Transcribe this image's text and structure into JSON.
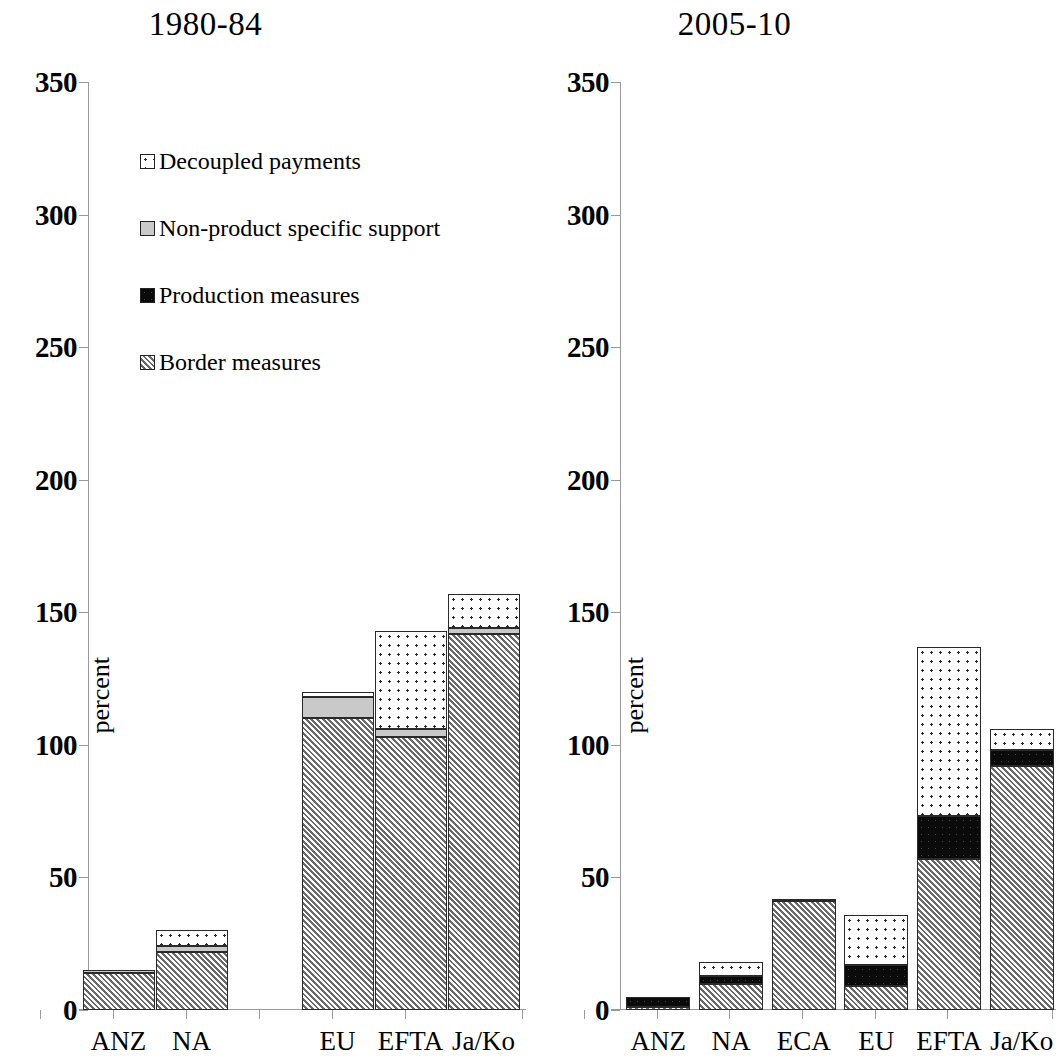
{
  "chart_data": [
    {
      "type": "bar",
      "title": "1980-84",
      "xlabel": "",
      "ylabel": "percent",
      "ylim": [
        0,
        350
      ],
      "yticks": [
        0,
        50,
        100,
        150,
        200,
        250,
        300,
        350
      ],
      "grid": false,
      "stacked": true,
      "legend_position": "inside-top-left",
      "categories": [
        "ANZ",
        "NA",
        "",
        "EU",
        "EFTA",
        "Ja/Ko"
      ],
      "series": [
        {
          "name": "Border measures",
          "values": [
            14,
            22,
            0,
            110,
            103,
            142
          ]
        },
        {
          "name": "Production measures",
          "values": [
            0,
            0,
            0,
            0,
            0,
            0
          ]
        },
        {
          "name": "Non-product specific  support",
          "values": [
            1,
            2,
            0,
            8,
            3,
            2
          ]
        },
        {
          "name": "Decoupled payments",
          "values": [
            0,
            6,
            0,
            2,
            37,
            13
          ]
        }
      ],
      "totals": [
        15,
        30,
        0,
        120,
        143,
        157
      ]
    },
    {
      "type": "bar",
      "title": "2005-10",
      "xlabel": "",
      "ylabel": "percent",
      "ylim": [
        0,
        350
      ],
      "yticks": [
        0,
        50,
        100,
        150,
        200,
        250,
        300,
        350
      ],
      "grid": false,
      "stacked": true,
      "legend_position": "none",
      "categories": [
        "ANZ",
        "NA",
        "ECA",
        "EU",
        "EFTA",
        "Ja/Ko"
      ],
      "series": [
        {
          "name": "Border measures",
          "values": [
            1,
            10,
            41,
            9,
            57,
            92
          ]
        },
        {
          "name": "Production measures",
          "values": [
            4,
            3,
            0,
            8,
            16,
            6
          ]
        },
        {
          "name": "Non-product specific  support",
          "values": [
            0,
            0,
            1,
            0,
            0,
            0
          ]
        },
        {
          "name": "Decoupled payments",
          "values": [
            0,
            5,
            0,
            19,
            64,
            8
          ]
        }
      ],
      "totals": [
        5,
        18,
        42,
        36,
        137,
        106
      ]
    }
  ],
  "left_panel": {
    "title": "1980-84",
    "ylabel": "percent",
    "yticks": [
      "350",
      "300",
      "250",
      "200",
      "150",
      "100",
      "50",
      "0"
    ],
    "xlabels": [
      "ANZ",
      "NA",
      "",
      "EU",
      "EFTA",
      "Ja/Ko"
    ]
  },
  "right_panel": {
    "title": "2005-10",
    "ylabel": "percent",
    "yticks": [
      "350",
      "300",
      "250",
      "200",
      "150",
      "100",
      "50",
      "0"
    ],
    "xlabels": [
      "ANZ",
      "NA",
      "ECA",
      "EU",
      "EFTA",
      "Ja/Ko"
    ]
  },
  "legend": {
    "items": [
      {
        "label": "Decoupled payments",
        "swatch": "decoupled",
        "color": "#ffffff"
      },
      {
        "label": "Non-product specific  support",
        "swatch": "nonproduct",
        "color": "#c9c9c9"
      },
      {
        "label": "Production measures",
        "swatch": "production",
        "color": "#0b0b0b"
      },
      {
        "label": "Border measures",
        "swatch": "border",
        "color": "#d8d8d8"
      }
    ]
  }
}
